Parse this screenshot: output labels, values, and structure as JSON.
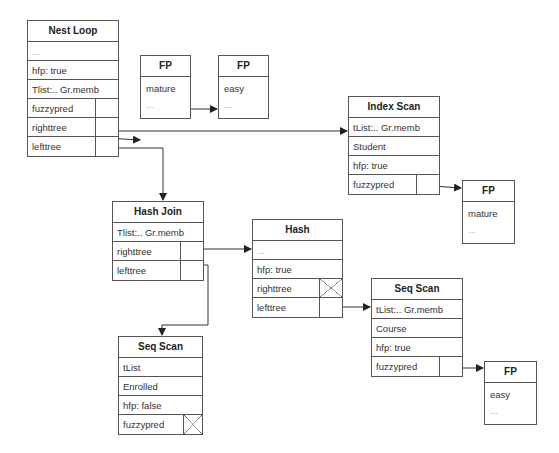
{
  "nodes": {
    "nest_loop": {
      "title": "Nest Loop",
      "rows": [
        "...",
        "hfp: true",
        "Tlist:.. Gr.memb",
        "fuzzypred",
        "righttree",
        "lefttree"
      ]
    },
    "fp_mature_1": {
      "title": "FP",
      "value": "mature",
      "more": "..."
    },
    "fp_easy_1": {
      "title": "FP",
      "value": "easy",
      "more": "..."
    },
    "index_scan": {
      "title": "Index Scan",
      "rows": [
        "tList:.. Gr.memb",
        "Student",
        "hfp: true",
        "fuzzypred"
      ]
    },
    "fp_mature_2": {
      "title": "FP",
      "value": "mature",
      "more": "..."
    },
    "hash_join": {
      "title": "Hash Join",
      "rows": [
        "Tlist:.. Gr.memb",
        "righttree",
        "lefttree"
      ]
    },
    "hash": {
      "title": "Hash",
      "rows": [
        "...",
        "hfp: true",
        "righttree",
        "lefttree"
      ]
    },
    "seq_scan_course": {
      "title": "Seq Scan",
      "rows": [
        "tList:.. Gr.memb",
        "Course",
        "hfp: true",
        "fuzzypred"
      ]
    },
    "fp_easy_2": {
      "title": "FP",
      "value": "easy",
      "more": "..."
    },
    "seq_scan_enrolled": {
      "title": "Seq Scan",
      "rows": [
        "tList",
        "Enrolled",
        "hfp: false",
        "fuzzypred"
      ]
    }
  }
}
